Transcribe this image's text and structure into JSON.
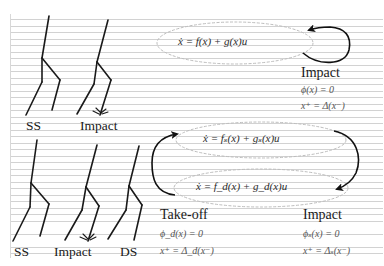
{
  "diagram": {
    "background": "lined-paper",
    "colors": {
      "ink": "#1a1a1a",
      "ellipse": "#bdbdbd",
      "ruling": "#d2d2d2"
    },
    "top_section": {
      "figures": [
        {
          "label": "SS"
        },
        {
          "label": "Impact"
        }
      ],
      "mode": {
        "equation": "ẋ = f(x) + g(x)u"
      },
      "transition": {
        "title": "Impact",
        "guard": "ϕ(x) = 0",
        "reset": "x⁺ = Δ(x⁻)"
      }
    },
    "bottom_section": {
      "figures": [
        {
          "label": "SS"
        },
        {
          "label": "Impact"
        },
        {
          "label": "DS"
        }
      ],
      "modes": [
        {
          "equation": "ẋ = fₛ(x) + gₛ(x)u"
        },
        {
          "equation": "ẋ = f_d(x) + g_d(x)u"
        }
      ],
      "transitions": [
        {
          "title": "Take-off",
          "guard": "ϕ_d(x) = 0",
          "reset": "x⁺ = Δ_d(x⁻)"
        },
        {
          "title": "Impact",
          "guard": "ϕₛ(x) = 0",
          "reset": "x⁺ = Δₛ(x⁻)"
        }
      ]
    }
  }
}
